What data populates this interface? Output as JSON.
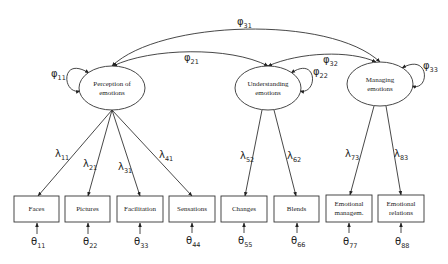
{
  "diagram": {
    "type": "confirmatory-factor-analysis-path-diagram",
    "latent_factors": [
      {
        "id": "f1",
        "label_line1": "Perception of",
        "label_line2": "emotions",
        "variance": {
          "symbol": "φ",
          "sub": "11"
        }
      },
      {
        "id": "f2",
        "label_line1": "Understanding",
        "label_line2": "emotions",
        "variance": {
          "symbol": "φ",
          "sub": "22"
        }
      },
      {
        "id": "f3",
        "label_line1": "Managing",
        "label_line2": "emotions",
        "variance": {
          "symbol": "φ",
          "sub": "33"
        }
      }
    ],
    "covariances": [
      {
        "from": "f1",
        "to": "f2",
        "symbol": "φ",
        "sub": "21"
      },
      {
        "from": "f2",
        "to": "f3",
        "symbol": "φ",
        "sub": "32"
      },
      {
        "from": "f1",
        "to": "f3",
        "symbol": "φ",
        "sub": "31"
      }
    ],
    "indicators": [
      {
        "id": "x1",
        "line1": "Faces",
        "line2": "",
        "factor": "f1",
        "loading": {
          "symbol": "λ",
          "sub": "11"
        },
        "error": {
          "symbol": "θ",
          "sub": "11"
        }
      },
      {
        "id": "x2",
        "line1": "Pictures",
        "line2": "",
        "factor": "f1",
        "loading": {
          "symbol": "λ",
          "sub": "21"
        },
        "error": {
          "symbol": "θ",
          "sub": "22"
        }
      },
      {
        "id": "x3",
        "line1": "Facilitation",
        "line2": "",
        "factor": "f1",
        "loading": {
          "symbol": "λ",
          "sub": "31"
        },
        "error": {
          "symbol": "θ",
          "sub": "33"
        }
      },
      {
        "id": "x4",
        "line1": "Sensations",
        "line2": "",
        "factor": "f1",
        "loading": {
          "symbol": "λ",
          "sub": "41"
        },
        "error": {
          "symbol": "θ",
          "sub": "44"
        }
      },
      {
        "id": "x5",
        "line1": "Changes",
        "line2": "",
        "factor": "f2",
        "loading": {
          "symbol": "λ",
          "sub": "52"
        },
        "error": {
          "symbol": "θ",
          "sub": "55"
        }
      },
      {
        "id": "x6",
        "line1": "Blends",
        "line2": "",
        "factor": "f2",
        "loading": {
          "symbol": "λ",
          "sub": "62"
        },
        "error": {
          "symbol": "θ",
          "sub": "66"
        }
      },
      {
        "id": "x7",
        "line1": "Emotional",
        "line2": "managem.",
        "factor": "f3",
        "loading": {
          "symbol": "λ",
          "sub": "73"
        },
        "error": {
          "symbol": "θ",
          "sub": "77"
        }
      },
      {
        "id": "x8",
        "line1": "Emotional",
        "line2": "relations",
        "factor": "f3",
        "loading": {
          "symbol": "λ",
          "sub": "83"
        },
        "error": {
          "symbol": "θ",
          "sub": "88"
        }
      }
    ],
    "colors": {
      "stroke": "#333333",
      "text": "#222222",
      "background": "#ffffff"
    }
  }
}
